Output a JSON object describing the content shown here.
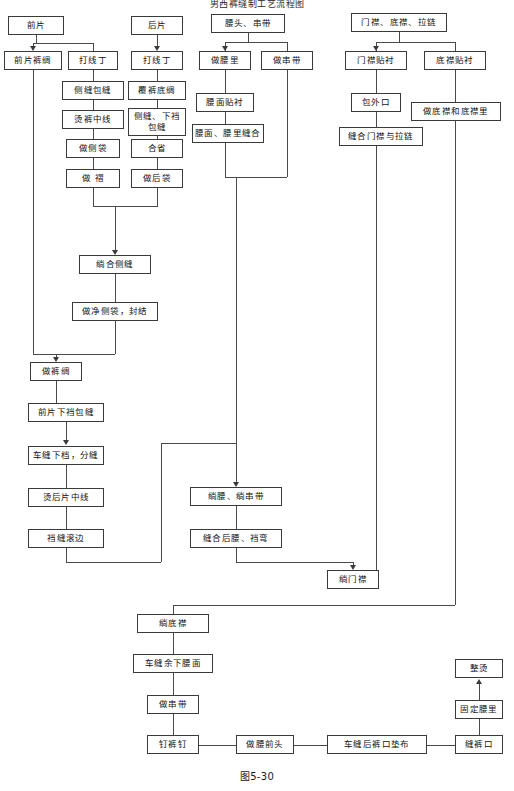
{
  "figure": {
    "title": "男西裤缝制工艺流程图",
    "caption": "图5-30"
  },
  "nodes": {
    "front_panel": "前片",
    "back_panel": "后片",
    "waist_loop": "腰头、串带",
    "fly_underfly_zipper": "门襟、底襟、拉链",
    "front_panel_lining": "前片裤绸",
    "mark_front": "打线丁",
    "mark_back": "打线丁",
    "make_waist_lining": "做腰里",
    "make_loop": "做串带",
    "fly_interlining": "门襟贴衬",
    "underfly_interlining": "底襟贴衬",
    "side_seam_overlock": "侧缝包缝",
    "back_panel_overlock": "覆裤底绸",
    "waist_face_interlining": "腰面贴衬",
    "bag_outer_opening": "包外口",
    "make_underfly_and_lining": "做底襟和底襟里",
    "press_center_line": "烫裤中线",
    "side_crotch_overlock": "侧缝、下裆包缝",
    "waist_face_lining_seam": "腰面、腰里缝合",
    "sew_fly_zipper": "缝合门襟与拉链",
    "make_side_pocket": "做侧袋",
    "join_dart": "合省",
    "make_pleat": "做 褶",
    "make_back_pocket": "做后袋",
    "join_side_seam": "绱合侧缝",
    "finish_side_pocket": "做净侧袋，封结",
    "make_trouser_lining": "做裤绸",
    "front_crotch_overlock": "前片下裆包缝",
    "sew_crotch_open": "车缝下档，分缝",
    "press_back_center": "烫后片中线",
    "crotch_seam_binding": "裆缝滚边",
    "attach_waist_loop": "绱腰、绱串带",
    "sew_back_waist_crotch": "缝合后腰、裆弯",
    "attach_fly": "绱门襟",
    "attach_underfly": "绱底襟",
    "sew_remaining_waist": "车缝余下腰面",
    "make_loop_2": "做串带",
    "nail_button": "钉裤钉",
    "make_waist_front": "做腰前头",
    "sew_back_hem_pad": "车缝后裤口垫布",
    "sew_hem": "缝裤口",
    "fix_waist_lining": "固定腰里",
    "final_press": "整烫"
  },
  "style": {
    "line_color": "#4a4a4a",
    "border_color": "#3a3a3a",
    "text_color": "#111111",
    "background": "#ffffff"
  }
}
